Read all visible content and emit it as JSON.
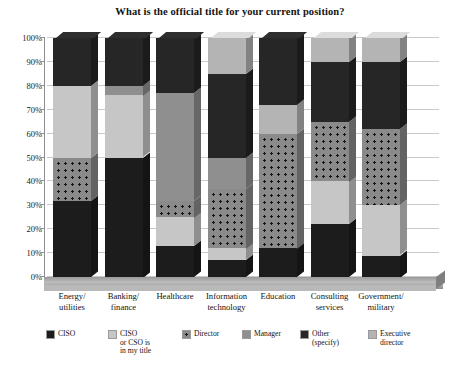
{
  "chart_data": {
    "type": "bar",
    "subtype": "stacked-column-100-3d",
    "title": "What is the official title for your current position?",
    "xlabel": "",
    "ylabel": "",
    "ylim": [
      0,
      100
    ],
    "ytick_labels": [
      "0%",
      "10%",
      "20%",
      "30%",
      "40%",
      "50%",
      "60%",
      "70%",
      "80%",
      "90%",
      "100%"
    ],
    "ytick_values": [
      0,
      10,
      20,
      30,
      40,
      50,
      60,
      70,
      80,
      90,
      100
    ],
    "grid": true,
    "legend_position": "bottom",
    "categories": [
      "Energy/\nutilities",
      "Banking/\nfinance",
      "Healthcare",
      "Information\ntechnology",
      "Education",
      "Consulting\nservices",
      "Government/\nmilitary"
    ],
    "series": [
      {
        "name": "CISO",
        "color": "#1c1c1c",
        "pattern": "solid-dark",
        "values": [
          32,
          50,
          13,
          7,
          12,
          22,
          9
        ]
      },
      {
        "name": "CISO\nor CSO is\nin my title",
        "color": "#c6c6c6",
        "pattern": "solid-light",
        "values": [
          0,
          0,
          12,
          5,
          0,
          18,
          21
        ]
      },
      {
        "name": "Director",
        "color": "#8a8a8a",
        "pattern": "dotted",
        "values": [
          18,
          0,
          7,
          25,
          48,
          25,
          32
        ]
      },
      {
        "name": "Manager",
        "color": "#8f8f8f",
        "pattern": "solid-mid",
        "values": [
          30,
          26,
          45,
          13,
          0,
          0,
          0
        ]
      },
      {
        "name": "Other\n(specify)",
        "color": "#262626",
        "pattern": "solid-dark",
        "values": [
          20,
          4,
          23,
          35,
          0,
          25,
          28
        ]
      },
      {
        "name": "Executive\ndirector",
        "color": "#b4b4b4",
        "pattern": "solid-light",
        "values": [
          0,
          20,
          0,
          15,
          12,
          10,
          10
        ]
      }
    ],
    "stack_order_bottom_to_top": [
      [
        "CISO",
        "Director",
        "Manager",
        "Other (specify)"
      ],
      [
        "CISO",
        "Manager",
        "Executive director",
        "Other (specify)"
      ],
      [
        "CISO",
        "CISO or CSO is in my title",
        "Director",
        "Manager",
        "Other (specify)"
      ],
      [
        "CISO",
        "CISO or CSO is in my title",
        "Director",
        "Manager",
        "Other (specify)",
        "Executive director"
      ],
      [
        "CISO",
        "Director",
        "Executive director",
        "Other (specify)"
      ],
      [
        "CISO",
        "CISO or CSO is in my title",
        "Director",
        "Other (specify)",
        "Executive director"
      ],
      [
        "CISO",
        "CISO or CSO is in my title",
        "Director",
        "Other (specify)",
        "Executive director"
      ]
    ],
    "columns": [
      {
        "category": "Energy/\nutilities",
        "segments": [
          {
            "series": "CISO",
            "start": 0,
            "end": 32,
            "fill": "ciso"
          },
          {
            "series": "Director",
            "start": 32,
            "end": 50,
            "fill": "director"
          },
          {
            "series": "Manager",
            "start": 50,
            "end": 80,
            "fill": "ciso-title"
          },
          {
            "series": "Other (specify)",
            "start": 80,
            "end": 100,
            "fill": "other"
          }
        ]
      },
      {
        "category": "Banking/\nfinance",
        "segments": [
          {
            "series": "CISO",
            "start": 0,
            "end": 50,
            "fill": "ciso"
          },
          {
            "series": "Manager",
            "start": 50,
            "end": 76,
            "fill": "ciso-title"
          },
          {
            "series": "Executive director",
            "start": 76,
            "end": 80,
            "fill": "manager"
          },
          {
            "series": "Other (specify)",
            "start": 80,
            "end": 100,
            "fill": "other"
          }
        ]
      },
      {
        "category": "Healthcare",
        "segments": [
          {
            "series": "CISO",
            "start": 0,
            "end": 13,
            "fill": "ciso"
          },
          {
            "series": "CISO or CSO is in my title",
            "start": 13,
            "end": 25,
            "fill": "ciso-title"
          },
          {
            "series": "Director",
            "start": 25,
            "end": 32,
            "fill": "director"
          },
          {
            "series": "Manager",
            "start": 32,
            "end": 77,
            "fill": "manager"
          },
          {
            "series": "Other (specify)",
            "start": 77,
            "end": 100,
            "fill": "other"
          }
        ]
      },
      {
        "category": "Information\ntechnology",
        "segments": [
          {
            "series": "CISO",
            "start": 0,
            "end": 7,
            "fill": "ciso"
          },
          {
            "series": "CISO or CSO is in my title",
            "start": 7,
            "end": 12,
            "fill": "ciso-title"
          },
          {
            "series": "Director",
            "start": 12,
            "end": 37,
            "fill": "director"
          },
          {
            "series": "Manager",
            "start": 37,
            "end": 50,
            "fill": "manager"
          },
          {
            "series": "Other (specify)",
            "start": 50,
            "end": 85,
            "fill": "other"
          },
          {
            "series": "Executive director",
            "start": 85,
            "end": 100,
            "fill": "exec"
          }
        ]
      },
      {
        "category": "Education",
        "segments": [
          {
            "series": "CISO",
            "start": 0,
            "end": 12,
            "fill": "ciso"
          },
          {
            "series": "Director",
            "start": 12,
            "end": 60,
            "fill": "director"
          },
          {
            "series": "Executive director",
            "start": 60,
            "end": 72,
            "fill": "exec"
          },
          {
            "series": "Other (specify)",
            "start": 72,
            "end": 100,
            "fill": "other"
          }
        ]
      },
      {
        "category": "Consulting\nservices",
        "segments": [
          {
            "series": "CISO",
            "start": 0,
            "end": 22,
            "fill": "ciso"
          },
          {
            "series": "CISO or CSO is in my title",
            "start": 22,
            "end": 40,
            "fill": "ciso-title"
          },
          {
            "series": "Director",
            "start": 40,
            "end": 65,
            "fill": "director"
          },
          {
            "series": "Other (specify)",
            "start": 65,
            "end": 90,
            "fill": "other"
          },
          {
            "series": "Executive director",
            "start": 90,
            "end": 100,
            "fill": "exec"
          }
        ]
      },
      {
        "category": "Government/\nmilitary",
        "segments": [
          {
            "series": "CISO",
            "start": 0,
            "end": 9,
            "fill": "ciso"
          },
          {
            "series": "CISO or CSO is in my title",
            "start": 9,
            "end": 30,
            "fill": "ciso-title"
          },
          {
            "series": "Director",
            "start": 30,
            "end": 62,
            "fill": "director"
          },
          {
            "series": "Other (specify)",
            "start": 62,
            "end": 90,
            "fill": "other"
          },
          {
            "series": "Executive director",
            "start": 90,
            "end": 100,
            "fill": "exec"
          }
        ]
      }
    ]
  },
  "legend": {
    "items": [
      {
        "label": "CISO",
        "fill": "ciso"
      },
      {
        "label": "CISO\nor CSO is\nin my title",
        "fill": "ciso-title"
      },
      {
        "label": "Director",
        "fill": "director"
      },
      {
        "label": "Manager",
        "fill": "manager"
      },
      {
        "label": "Other\n(specify)",
        "fill": "other"
      },
      {
        "label": "Executive\ndirector",
        "fill": "exec"
      }
    ]
  }
}
